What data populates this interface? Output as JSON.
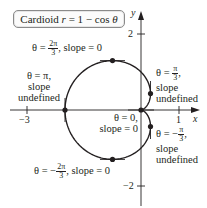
{
  "title": {
    "prefix": "Cardioid ",
    "r": "r",
    "eq": " = 1 − cos ",
    "theta": "θ"
  },
  "axes": {
    "x_label": "x",
    "y_label": "y",
    "ticks": {
      "x_neg3": "−3",
      "x_1": "1",
      "y_2": "2",
      "y_neg2": "−2"
    }
  },
  "annotations": {
    "top": {
      "prefix": "θ = ",
      "num": "2π",
      "den": "3",
      "suffix": ", slope = 0"
    },
    "left": {
      "line1": "θ = π,",
      "line2": "slope",
      "line3": "undefined"
    },
    "right_upper": {
      "prefix": "θ = ",
      "num": "π",
      "den": "3",
      "suffix": ",",
      "line2": "slope",
      "line3": "undefined"
    },
    "origin": {
      "line1": "θ = 0,",
      "line2": "slope = 0"
    },
    "right_lower": {
      "prefix": "θ = −",
      "num": "π",
      "den": "3",
      "suffix": ",",
      "line2": "slope",
      "line3": "undefined"
    },
    "bottom": {
      "prefix": "θ = −",
      "num": "2π",
      "den": "3",
      "suffix": ", slope = 0"
    }
  },
  "chart_data": {
    "type": "line",
    "title": "Cardioid r = 1 − cos θ",
    "equation": "r = 1 - cos(theta)",
    "xlabel": "x",
    "ylabel": "y",
    "xlim": [
      -3.2,
      1.7
    ],
    "ylim": [
      -2.5,
      2.6
    ],
    "x_ticks": [
      -3,
      1
    ],
    "y_ticks": [
      2,
      -2
    ],
    "grid": false,
    "marked_points": [
      {
        "theta": "0",
        "x": 0,
        "y": 0,
        "slope": "0"
      },
      {
        "theta": "π/3",
        "x": 0.25,
        "y": 0.433,
        "slope": "undefined"
      },
      {
        "theta": "2π/3",
        "x": -0.75,
        "y": 1.299,
        "slope": "0"
      },
      {
        "theta": "π",
        "x": -2,
        "y": 0,
        "slope": "undefined"
      },
      {
        "theta": "-2π/3",
        "x": -0.75,
        "y": -1.299,
        "slope": "0"
      },
      {
        "theta": "-π/3",
        "x": 0.25,
        "y": -0.433,
        "slope": "undefined"
      }
    ]
  },
  "colors": {
    "curve": "#231f20",
    "axis": "#231f20",
    "box_border": "#8a8a8a"
  }
}
